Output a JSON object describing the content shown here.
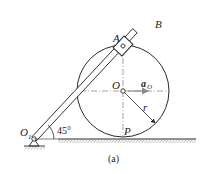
{
  "figure": {
    "labels": {
      "B": "B",
      "A": "A",
      "O": "O",
      "a_O_main": "a",
      "a_O_sub": "O",
      "r": "r",
      "P": "P",
      "O1_main": "O",
      "O1_sub": "1",
      "angle": "45°"
    },
    "caption": "(a)",
    "colors": {
      "line": "#2a2a2a",
      "arrow": "#8a8a8a",
      "hatch": "#444444"
    }
  }
}
